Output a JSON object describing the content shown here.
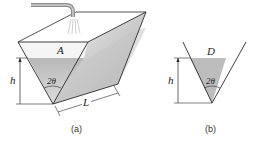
{
  "figure": {
    "panel_a": {
      "caption": "(a)",
      "labels": {
        "area": "A",
        "height": "h",
        "angle": "2θ",
        "length": "L"
      },
      "elements": [
        "faucet",
        "water-spray",
        "triangular-trough",
        "water-surface"
      ]
    },
    "panel_b": {
      "caption": "(b)",
      "labels": {
        "width": "D",
        "height": "h",
        "angle": "2θ"
      },
      "elements": [
        "v-cross-section",
        "water-fill"
      ]
    },
    "colors": {
      "line": "#2a2a2a",
      "water": "#c8c8c8",
      "water_dark": "#a8a8a8",
      "pipe": "#9a9a9a"
    }
  }
}
